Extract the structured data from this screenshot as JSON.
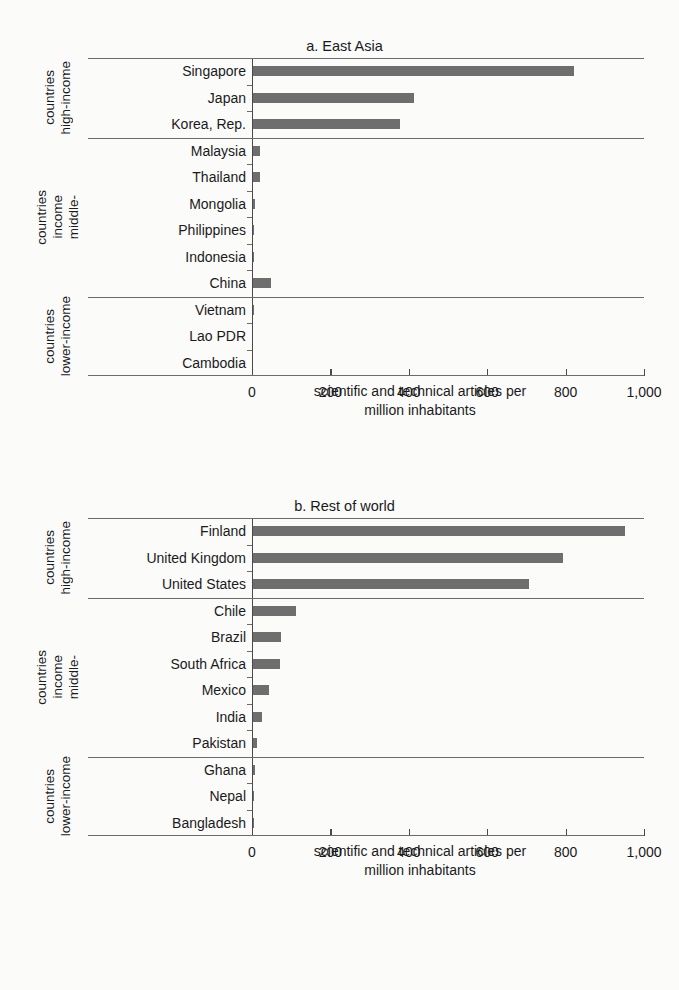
{
  "page": {
    "top_strip_text": "·   ·      ·            ·                              ·"
  },
  "axis_caption": {
    "line1": "scientific and technical articles per",
    "line2": "million inhabitants"
  },
  "group_labels": {
    "high": [
      "high-income",
      "countries"
    ],
    "middle": [
      "middle-",
      "income",
      "countries"
    ],
    "lower": [
      "lower-income",
      "countries"
    ]
  },
  "chart_data": [
    {
      "type": "bar",
      "orientation": "horizontal",
      "title": "a. East Asia",
      "xlabel": "scientific and technical articles per million inhabitants",
      "ylabel": "",
      "xlim": [
        0,
        1000
      ],
      "xticks": [
        0,
        200,
        400,
        600,
        800,
        1000
      ],
      "xtick_labels": [
        "0",
        "200",
        "400",
        "600",
        "800",
        "1,000"
      ],
      "grid": false,
      "legend": false,
      "bar_color": "#6e6e6e",
      "categories": [
        "Singapore",
        "Japan",
        "Korea, Rep.",
        "Malaysia",
        "Thailand",
        "Mongolia",
        "Philippines",
        "Indonesia",
        "China",
        "Vietnam",
        "Lao PDR",
        "Cambodia"
      ],
      "values": [
        820,
        410,
        375,
        18,
        17,
        5,
        1,
        1,
        45,
        1,
        0,
        0
      ],
      "groups": [
        {
          "label": "high-income countries",
          "categories": [
            "Singapore",
            "Japan",
            "Korea, Rep."
          ]
        },
        {
          "label": "middle-income countries",
          "categories": [
            "Malaysia",
            "Thailand",
            "Mongolia",
            "Philippines",
            "Indonesia",
            "China"
          ]
        },
        {
          "label": "lower-income countries",
          "categories": [
            "Vietnam",
            "Lao PDR",
            "Cambodia"
          ]
        }
      ]
    },
    {
      "type": "bar",
      "orientation": "horizontal",
      "title": "b. Rest of world",
      "xlabel": "scientific and technical articles per million inhabitants",
      "ylabel": "",
      "xlim": [
        0,
        1000
      ],
      "xticks": [
        0,
        200,
        400,
        600,
        800,
        1000
      ],
      "xtick_labels": [
        "0",
        "200",
        "400",
        "600",
        "800",
        "1,000"
      ],
      "grid": false,
      "legend": false,
      "bar_color": "#6e6e6e",
      "categories": [
        "Finland",
        "United Kingdom",
        "United States",
        "Chile",
        "Brazil",
        "South Africa",
        "Mexico",
        "India",
        "Pakistan",
        "Ghana",
        "Nepal",
        "Bangladesh"
      ],
      "values": [
        950,
        790,
        705,
        110,
        72,
        68,
        40,
        22,
        9,
        4,
        2,
        2
      ],
      "groups": [
        {
          "label": "high-income countries",
          "categories": [
            "Finland",
            "United Kingdom",
            "United States"
          ]
        },
        {
          "label": "middle-income countries",
          "categories": [
            "Chile",
            "Brazil",
            "South Africa",
            "Mexico",
            "India",
            "Pakistan"
          ]
        },
        {
          "label": "lower-income countries",
          "categories": [
            "Ghana",
            "Nepal",
            "Bangladesh"
          ]
        }
      ]
    }
  ]
}
